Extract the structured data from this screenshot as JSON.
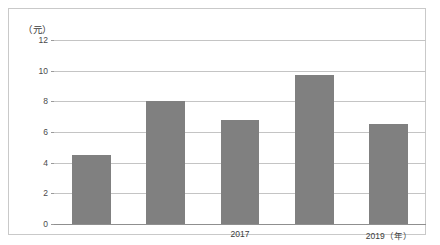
{
  "chart_data": {
    "type": "bar",
    "title": "",
    "subtitle": "",
    "xlabel": "年",
    "ylabel": "元",
    "y_unit_label": "（元）",
    "x_unit_label": "（年）",
    "categories": [
      "",
      "",
      "2017",
      "",
      "2019"
    ],
    "values": [
      4.5,
      8.0,
      6.8,
      9.7,
      6.5
    ],
    "visible_tick_labels": [
      "2017",
      "2019（年）"
    ],
    "yticks": [
      0,
      2,
      4,
      6,
      8,
      10,
      12
    ],
    "ytick_labels": [
      "0",
      "2",
      "4",
      "6",
      "8",
      "10",
      "12"
    ],
    "ylim": [
      0,
      12
    ],
    "grid": true,
    "grid_axis": "y",
    "legend": false,
    "legend_position": "none",
    "bar_color": "#808080",
    "gridline_color": "#c4c4c4",
    "axis_color": "#8f8f8f",
    "frame_color": "#c9c9c9",
    "background": "#ffffff"
  },
  "axis": {
    "y_unit": "（元）",
    "x_labels": [
      {
        "text": "2017",
        "bar_index": 2
      },
      {
        "text": "2019（年）",
        "bar_index": 4
      }
    ]
  }
}
